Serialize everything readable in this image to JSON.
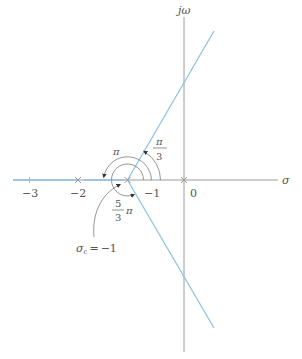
{
  "diagram": {
    "type": "root-locus-asymptotes",
    "axes": {
      "real_label": "σ",
      "imag_label": "jω"
    },
    "tick_labels": {
      "neg3": "−3",
      "neg2": "−2",
      "neg1": "−1",
      "zero": "0"
    },
    "poles": [
      {
        "name": "pole-0",
        "value": 0
      },
      {
        "name": "pole-neg1",
        "value": -1
      },
      {
        "name": "pole-neg2",
        "value": -2
      }
    ],
    "centroid": {
      "label": "σ",
      "subscript": "c",
      "equals": "=",
      "value": "−1"
    },
    "angles": {
      "pi_over_3": {
        "numerator": "π",
        "denominator": "3"
      },
      "pi": {
        "label": "π"
      },
      "five_thirds_pi": {
        "numerator": "5",
        "denominator": "3",
        "suffix": "π"
      }
    },
    "colors": {
      "locus": "#8fc3e3",
      "axis": "#9a9a9a",
      "text": "#555555"
    }
  }
}
